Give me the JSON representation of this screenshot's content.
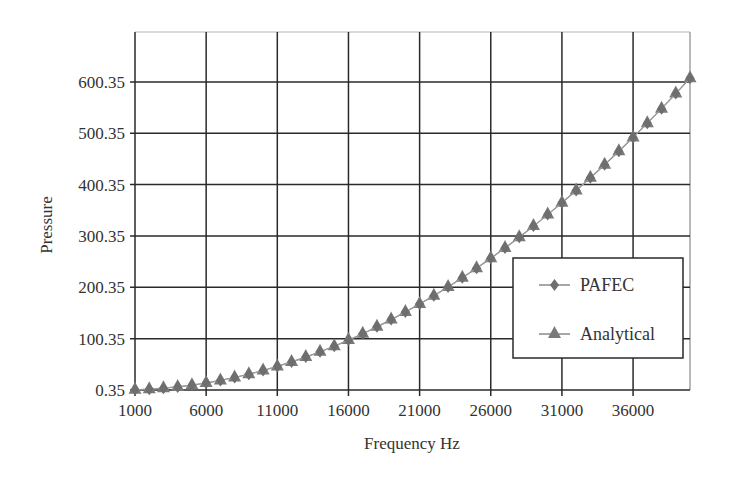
{
  "chart_data": {
    "type": "line",
    "title": "",
    "xlabel": "Frequency Hz",
    "ylabel": "Pressure",
    "xlim": [
      1000,
      40000
    ],
    "ylim": [
      0.35,
      700.35
    ],
    "x_ticks": [
      1000,
      6000,
      11000,
      16000,
      21000,
      26000,
      31000,
      36000
    ],
    "x_tick_labels": [
      "1000",
      "6000",
      "11000",
      "16000",
      "21000",
      "26000",
      "31000",
      "36000"
    ],
    "y_ticks": [
      0.35,
      100.35,
      200.35,
      300.35,
      400.35,
      500.35,
      600.35
    ],
    "y_tick_labels": [
      "0.35",
      "100.35",
      "200.35",
      "300.35",
      "400.35",
      "500.35",
      "600.35"
    ],
    "grid": true,
    "legend_position": "lower right (inside)",
    "x": [
      1000,
      2000,
      3000,
      4000,
      5000,
      6000,
      7000,
      8000,
      9000,
      10000,
      11000,
      12000,
      13000,
      14000,
      15000,
      16000,
      17000,
      18000,
      19000,
      20000,
      21000,
      22000,
      23000,
      24000,
      25000,
      26000,
      27000,
      28000,
      29000,
      30000,
      31000,
      32000,
      33000,
      34000,
      35000,
      36000,
      37000,
      38000,
      39000,
      40000
    ],
    "series": [
      {
        "name": "PAFEC",
        "marker": "diamond",
        "color": "#6e6e6e",
        "values": [
          0.7,
          1.9,
          3.8,
          6.4,
          9.8,
          14.0,
          19.0,
          24.6,
          31.1,
          38.3,
          46.3,
          55.0,
          64.5,
          74.7,
          85.7,
          97.5,
          110.0,
          123.3,
          137.4,
          152.2,
          167.7,
          184.0,
          201.1,
          219.0,
          237.5,
          256.9,
          277.0,
          297.9,
          319.5,
          341.9,
          365.0,
          388.9,
          413.6,
          439.0,
          465.2,
          492.2,
          519.9,
          548.3,
          577.6,
          607.6
        ]
      },
      {
        "name": "Analytical",
        "marker": "triangle",
        "color": "#7a7a7a",
        "values": [
          0.7,
          1.9,
          3.8,
          6.4,
          9.8,
          14.0,
          19.0,
          24.6,
          31.1,
          38.3,
          46.3,
          55.0,
          64.5,
          74.7,
          85.7,
          97.5,
          110.0,
          123.3,
          137.4,
          152.2,
          167.7,
          184.0,
          201.1,
          219.0,
          237.5,
          256.9,
          277.0,
          297.9,
          319.5,
          341.9,
          365.0,
          388.9,
          413.6,
          439.0,
          465.2,
          492.2,
          519.9,
          548.3,
          577.6,
          607.6
        ]
      }
    ]
  },
  "labels": {
    "xlabel": "Frequency Hz",
    "ylabel": "Pressure",
    "legend": [
      "PAFEC",
      "Analytical"
    ]
  },
  "colors": {
    "grid": "#2a2a2a",
    "frame_top": "#b5b5b5",
    "marker": "#757575",
    "line": "#9a9a9a"
  }
}
